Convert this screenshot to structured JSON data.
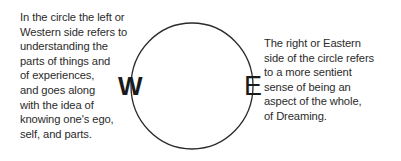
{
  "diagram": {
    "left_text": {
      "lines": [
        "In the circle the left or",
        "Western side refers to",
        "understanding the",
        "parts of things and",
        "of experiences,",
        "and goes along",
        "with the idea of",
        "knowing one's ego,",
        "self, and parts."
      ]
    },
    "right_text": {
      "lines": [
        "The right or Eastern",
        "side of the circle refers",
        "to a more sentient",
        "sense of being an",
        "aspect of the whole,",
        "of Dreaming."
      ]
    },
    "circle": {
      "west_label": "W",
      "east_label": "E",
      "stroke_color": "#2a2a2a"
    }
  }
}
